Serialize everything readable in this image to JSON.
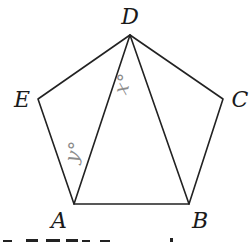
{
  "figure": {
    "type": "regular-pentagon",
    "vertices": [
      {
        "name": "A",
        "label": "A",
        "x": 74,
        "y": 204,
        "lx": 58,
        "ly": 229
      },
      {
        "name": "B",
        "label": "B",
        "x": 189,
        "y": 204,
        "lx": 200,
        "ly": 229
      },
      {
        "name": "C",
        "label": "C",
        "x": 223,
        "y": 99,
        "lx": 240,
        "ly": 108
      },
      {
        "name": "D",
        "label": "D",
        "x": 130,
        "y": 35,
        "lx": 130,
        "ly": 22
      },
      {
        "name": "E",
        "label": "E",
        "x": 38,
        "y": 99,
        "lx": 21,
        "ly": 108
      }
    ],
    "diagonals": [
      "AD",
      "BD"
    ],
    "angle_labels": [
      {
        "name": "x",
        "label": "x°",
        "at_vertex": "D",
        "color": "#8c8c8c"
      },
      {
        "name": "y",
        "label": "y°",
        "at_vertex": "A",
        "color": "#8c8c8c"
      }
    ]
  }
}
